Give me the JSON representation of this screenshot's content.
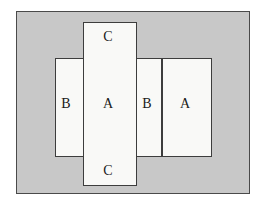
{
  "figure": {
    "name": "overlapping-rectangles-diagram",
    "canvas": {
      "width": 265,
      "height": 206,
      "background": "#ffffff"
    },
    "frame": {
      "name": "outer-panel",
      "fill": "#c8c8c8",
      "stroke": "#4a4a4a",
      "x": 16,
      "y": 11,
      "width": 234,
      "height": 183
    },
    "shapes": [
      {
        "id": "vertical-rectangle",
        "orientation": "vertical",
        "fill": "#f9f9f7",
        "stroke": "#3d3d3d",
        "x": 83,
        "y": 22,
        "width": 54,
        "height": 164
      },
      {
        "id": "horizontal-rectangle",
        "orientation": "horizontal",
        "fill": "#f9f9f7",
        "stroke": "#3d3d3d",
        "x": 55,
        "y": 58,
        "width": 157,
        "height": 99
      }
    ],
    "divider": {
      "id": "inner-vertical-divider",
      "stroke": "#3d3d3d",
      "x": 161,
      "y": 58,
      "height": 99
    },
    "labels": {
      "b_left": "B",
      "a_center": "A",
      "b_right": "B",
      "a_far_right": "A",
      "c_top": "C",
      "c_bottom": "C"
    }
  }
}
